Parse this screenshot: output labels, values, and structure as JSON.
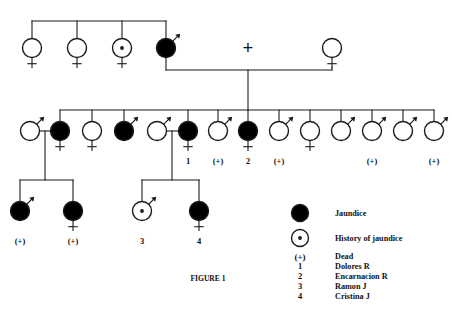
{
  "figure": {
    "caption": "Figure 1",
    "caption_x": 208,
    "caption_y": 281
  },
  "legend": {
    "items": [
      {
        "key": "jaundice",
        "symbol": "filled-circle",
        "label": "Jaundice"
      },
      {
        "key": "history-of-jaundice",
        "symbol": "dotted-circle",
        "label": "History of jaundice"
      },
      {
        "key": "dead",
        "symbol": "dagger-paren",
        "label": "Dead",
        "marker": "(+)"
      },
      {
        "key": "person-1",
        "symbol": "number",
        "label": "Dolores R",
        "marker": "1"
      },
      {
        "key": "person-2",
        "symbol": "number",
        "label": "Encarnacion R",
        "marker": "2"
      },
      {
        "key": "person-3",
        "symbol": "number",
        "label": "Ramon J",
        "marker": "3"
      },
      {
        "key": "person-4",
        "symbol": "number",
        "label": "Cristina J",
        "marker": "4"
      }
    ],
    "x_symbol": 300,
    "x_label": 335,
    "rows_y": [
      213,
      238,
      256,
      266,
      276,
      286,
      296
    ]
  },
  "colors": {
    "affected_fill": "#000000",
    "unaffected_fill": "#ffffff",
    "stroke": "#1a1a1a",
    "background": "#ffffff",
    "text": "#111111"
  },
  "style": {
    "symbol_radius": 9.5,
    "stroke_width": 1.4,
    "line_width": 1.1
  },
  "generations": [
    {
      "id": "generation-1",
      "y": 48,
      "sibline_y": 21,
      "sibline_x1": 32,
      "sibline_x2": 166,
      "members": [
        {
          "id": "g1-1",
          "x": 32,
          "sex": "female",
          "status": "unaffected",
          "label": "",
          "drop": true
        },
        {
          "id": "g1-2",
          "x": 77,
          "sex": "female",
          "status": "unaffected",
          "label": "",
          "drop": true
        },
        {
          "id": "g1-3",
          "x": 122,
          "sex": "female",
          "status": "history",
          "label": "",
          "drop": true
        },
        {
          "id": "g1-4",
          "x": 166,
          "sex": "male",
          "status": "affected",
          "label": "",
          "drop": true
        },
        {
          "id": "g1-5",
          "x": 332,
          "sex": "female",
          "status": "unaffected",
          "label": "",
          "drop": false
        }
      ],
      "mating": {
        "plus_x": 248,
        "plus_y": 48,
        "bar_y": 70,
        "bar_x1": 166,
        "bar_x2": 332,
        "descent_x": 248,
        "descent_y2": 110
      }
    },
    {
      "id": "generation-2",
      "y": 131,
      "sibline_y": 110,
      "sibline_x1": 60,
      "sibline_x2": 434,
      "members": [
        {
          "id": "g2-01",
          "x": 30,
          "sex": "male",
          "status": "unaffected",
          "label": "",
          "stem": false,
          "spouse": true
        },
        {
          "id": "g2-02",
          "x": 60,
          "sex": "female",
          "status": "affected",
          "label": "",
          "stem": true
        },
        {
          "id": "g2-03",
          "x": 92,
          "sex": "female",
          "status": "unaffected",
          "label": "",
          "stem": true
        },
        {
          "id": "g2-04",
          "x": 124,
          "sex": "male",
          "status": "affected",
          "label": "",
          "stem": true
        },
        {
          "id": "g2-05",
          "x": 157,
          "sex": "male",
          "status": "unaffected",
          "label": "",
          "stem": false,
          "spouse": true
        },
        {
          "id": "g2-06",
          "x": 188,
          "sex": "female",
          "status": "affected",
          "label": "1",
          "stem": true
        },
        {
          "id": "g2-07",
          "x": 218,
          "sex": "male",
          "status": "unaffected",
          "label": "(+)",
          "stem": true
        },
        {
          "id": "g2-08",
          "x": 248,
          "sex": "female",
          "status": "affected",
          "label": "2",
          "stem": true
        },
        {
          "id": "g2-09",
          "x": 279,
          "sex": "male",
          "status": "unaffected",
          "label": "(+)",
          "stem": true
        },
        {
          "id": "g2-10",
          "x": 310,
          "sex": "female",
          "status": "unaffected",
          "label": "",
          "stem": true
        },
        {
          "id": "g2-11",
          "x": 341,
          "sex": "male",
          "status": "unaffected",
          "label": "",
          "stem": true
        },
        {
          "id": "g2-12",
          "x": 372,
          "sex": "male",
          "status": "unaffected",
          "label": "(+)",
          "stem": true
        },
        {
          "id": "g2-13",
          "x": 403,
          "sex": "male",
          "status": "unaffected",
          "label": "",
          "stem": true
        },
        {
          "id": "g2-14",
          "x": 434,
          "sex": "male",
          "status": "unaffected",
          "label": "(+)",
          "stem": true
        }
      ],
      "matings": [
        {
          "id": "mating-a",
          "union_x": 45,
          "union_y": 131,
          "x1": 30,
          "x2": 60,
          "descent_x": 45,
          "descent_y2": 180
        },
        {
          "id": "mating-b",
          "union_x": 172,
          "union_y": 131,
          "x1": 157,
          "x2": 188,
          "descent_x": 172,
          "descent_y2": 180
        }
      ]
    },
    {
      "id": "generation-3",
      "y": 211,
      "members": [
        {
          "id": "g3-1",
          "x": 20,
          "sex": "male",
          "status": "affected",
          "label": "(+)",
          "family": "mating-a"
        },
        {
          "id": "g3-2",
          "x": 73,
          "sex": "female",
          "status": "affected",
          "label": "(+)",
          "family": "mating-a"
        },
        {
          "id": "g3-3",
          "x": 142,
          "sex": "male",
          "status": "history",
          "label": "3",
          "family": "mating-b"
        },
        {
          "id": "g3-4",
          "x": 199,
          "sex": "female",
          "status": "affected",
          "label": "4",
          "family": "mating-b"
        }
      ],
      "siblines": [
        {
          "id": "sibline-a",
          "y": 180,
          "x1": 20,
          "x2": 73
        },
        {
          "id": "sibline-b",
          "y": 180,
          "x1": 142,
          "x2": 199
        }
      ]
    }
  ]
}
